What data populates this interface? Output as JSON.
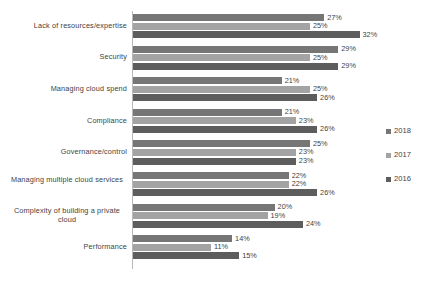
{
  "chart_data": {
    "type": "bar",
    "orientation": "horizontal",
    "title": "",
    "subtitle": "",
    "xlabel": "",
    "ylabel": "",
    "grid": false,
    "legend_position": "right",
    "xlim": [
      0,
      35
    ],
    "value_suffix": "%",
    "categories": [
      "Lack of resources/expertise",
      "Security",
      "Managing cloud spend",
      "Compliance",
      "Governance/control",
      "Managing multiple cloud services",
      "Complexity of building a private cloud",
      "Performance"
    ],
    "series": [
      {
        "name": "2018",
        "color": "#767676",
        "values": [
          27,
          29,
          21,
          21,
          25,
          22,
          20,
          14
        ],
        "labels": [
          "27%",
          "29%",
          "21%",
          "21%",
          "25%",
          "22%",
          "20%",
          "14%"
        ]
      },
      {
        "name": "2017",
        "color": "#a3a3a3",
        "values": [
          25,
          25,
          25,
          23,
          23,
          22,
          19,
          11
        ],
        "labels": [
          "25%",
          "25%",
          "25%",
          "23%",
          "23%",
          "22%",
          "19%",
          "11%"
        ]
      },
      {
        "name": "2016",
        "color": "#5d5d5d",
        "values": [
          32,
          29,
          26,
          26,
          23,
          26,
          24,
          15
        ],
        "labels": [
          "32%",
          "29%",
          "26%",
          "26%",
          "23%",
          "26%",
          "24%",
          "15%"
        ]
      }
    ]
  },
  "legend": {
    "items": [
      {
        "label": "2018",
        "color": "#767676"
      },
      {
        "label": "2017",
        "color": "#a3a3a3"
      },
      {
        "label": "2016",
        "color": "#5d5d5d"
      }
    ]
  }
}
